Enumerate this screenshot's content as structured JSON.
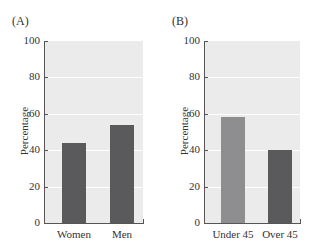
{
  "chart_data": [
    {
      "type": "bar",
      "panel_label": "(A)",
      "categories": [
        "Women",
        "Men"
      ],
      "values": [
        44,
        54
      ],
      "colors": [
        "#5a5a5c",
        "#5a5a5c"
      ],
      "title": "",
      "xlabel": "",
      "ylabel": "Percentage",
      "ylim": [
        0,
        100
      ],
      "yticks": [
        "0",
        "20",
        "40",
        "60",
        "80",
        "100"
      ],
      "grid": true,
      "background": "#ecebeb"
    },
    {
      "type": "bar",
      "panel_label": "(B)",
      "categories": [
        "Under 45",
        "Over 45"
      ],
      "values": [
        58,
        40
      ],
      "colors": [
        "#8e8e90",
        "#5a5a5c"
      ],
      "title": "",
      "xlabel": "",
      "ylabel": "Percentage",
      "ylim": [
        0,
        100
      ],
      "yticks": [
        "0",
        "20",
        "40",
        "60",
        "80",
        "100"
      ],
      "grid": true,
      "background": "#ecebeb"
    }
  ]
}
